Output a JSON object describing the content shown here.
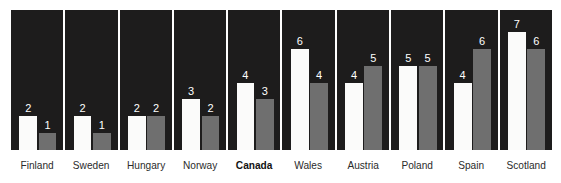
{
  "chart_data": {
    "type": "bar",
    "title": "",
    "subtitle": "",
    "xlabel": "",
    "ylabel": "",
    "ylim": [
      0,
      8
    ],
    "grid": false,
    "legend_position": "none",
    "layout": "small-multiples, one dark panel per country, two bars per panel",
    "categories": [
      "Finland",
      "Sweden",
      "Hungary",
      "Norway",
      "Canada",
      "Wales",
      "Austria",
      "Poland",
      "Spain",
      "Scotland"
    ],
    "highlighted_category": "Canada",
    "series": [
      {
        "name": "white-bar",
        "color": "#fbfbfa",
        "values": [
          2,
          2,
          2,
          3,
          4,
          6,
          4,
          5,
          4,
          7
        ]
      },
      {
        "name": "gray-bar",
        "color": "#6f6f6f",
        "values": [
          1,
          1,
          2,
          2,
          3,
          4,
          5,
          5,
          6,
          6
        ]
      }
    ],
    "panels": [
      {
        "label": "Finland",
        "bold": false,
        "white_value": 2,
        "white_label": "2",
        "gray_value": 1,
        "gray_label": "1"
      },
      {
        "label": "Sweden",
        "bold": false,
        "white_value": 2,
        "white_label": "2",
        "gray_value": 1,
        "gray_label": "1"
      },
      {
        "label": "Hungary",
        "bold": false,
        "white_value": 2,
        "white_label": "2",
        "gray_value": 2,
        "gray_label": "2"
      },
      {
        "label": "Norway",
        "bold": false,
        "white_value": 3,
        "white_label": "3",
        "gray_value": 2,
        "gray_label": "2"
      },
      {
        "label": "Canada",
        "bold": true,
        "white_value": 4,
        "white_label": "4",
        "gray_value": 3,
        "gray_label": "3"
      },
      {
        "label": "Wales",
        "bold": false,
        "white_value": 6,
        "white_label": "6",
        "gray_value": 4,
        "gray_label": "4"
      },
      {
        "label": "Austria",
        "bold": false,
        "white_value": 4,
        "white_label": "4",
        "gray_value": 5,
        "gray_label": "5"
      },
      {
        "label": "Poland",
        "bold": false,
        "white_value": 5,
        "white_label": "5",
        "gray_value": 5,
        "gray_label": "5"
      },
      {
        "label": "Spain",
        "bold": false,
        "white_value": 4,
        "white_label": "4",
        "gray_value": 6,
        "gray_label": "6"
      },
      {
        "label": "Scotland",
        "bold": false,
        "white_value": 7,
        "white_label": "7",
        "gray_value": 6,
        "gray_label": "6"
      }
    ]
  },
  "style": {
    "panel_background": "#1d1c1c",
    "white_bar_color": "#fbfbfa",
    "gray_bar_color": "#6f6f6f",
    "value_label_color": "#ffffff",
    "category_label_color": "#2b2b2b",
    "page_background": "#ffffff"
  }
}
